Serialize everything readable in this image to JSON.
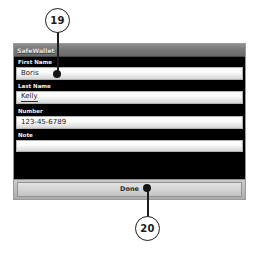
{
  "window": {
    "title": "SafeWallet"
  },
  "form": {
    "fields": [
      {
        "label": "First Name",
        "value": "Boris",
        "placeholder": "",
        "misspelled": false
      },
      {
        "label": "Last Name",
        "value": "Kelly",
        "placeholder": "",
        "misspelled": true
      },
      {
        "label": "Number",
        "value": "123-45-6789",
        "placeholder": "",
        "misspelled": false
      },
      {
        "label": "Note",
        "value": "",
        "placeholder": "",
        "misspelled": false
      }
    ]
  },
  "toolbar": {
    "done_label": "Done"
  },
  "callouts": [
    {
      "number": "19",
      "target": "first-name-input"
    },
    {
      "number": "20",
      "target": "done-button"
    }
  ],
  "colors": {
    "field_background": "#000000",
    "input_fill": "#ffffff",
    "titlebar": "#787878",
    "toolbar": "#bdbdbd",
    "callout_stroke": "#1c1c1c"
  }
}
